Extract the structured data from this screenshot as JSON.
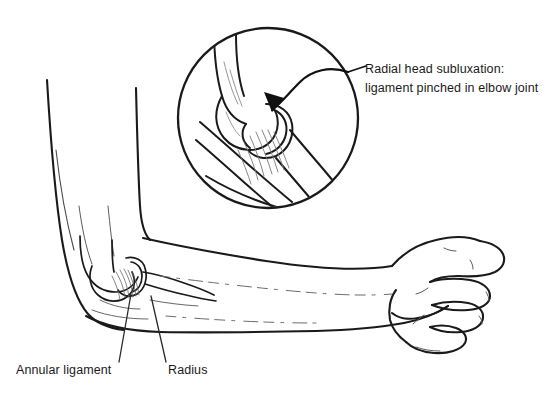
{
  "figure": {
    "background_color": "#ffffff",
    "ink_color": "#1a1a1a",
    "width": 556,
    "height": 409
  },
  "callout": {
    "line1": "Radial head subluxation:",
    "line2": "ligament pinched in elbow joint",
    "leader_icon": "leader-line",
    "arrow_icon": "curved-arrow-icon"
  },
  "labels": {
    "annular_ligament": "Annular ligament",
    "radius": "Radius"
  },
  "parts": {
    "magnifier_icon": "magnifier-circle-inset",
    "upper_arm": "upper-arm-outline",
    "forearm": "forearm-outline",
    "hand": "hand-outline",
    "elbow_joint": "elbow-joint-bones",
    "ligament_fibers": "annular-ligament-fibers"
  }
}
